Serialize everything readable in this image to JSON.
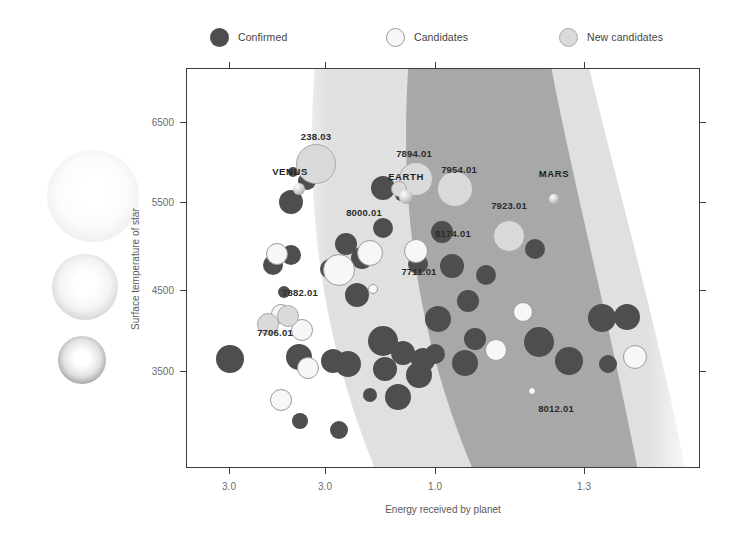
{
  "legend": {
    "items": [
      {
        "label": "Confirmed",
        "color": "#4e4e4e",
        "left": 0,
        "style": "confirmed"
      },
      {
        "label": "Candidates",
        "color": "#f7f7f7",
        "left": 176,
        "style": "candidate"
      },
      {
        "label": "New candidates",
        "color": "#dadada",
        "left": 349,
        "style": "newcand"
      }
    ]
  },
  "orbs": [
    {
      "name": "star-orb-large",
      "cx": 93,
      "cy": 196,
      "r": 46,
      "core": "#ffffff",
      "mid": "#fbfbfb",
      "edge": "#ededed"
    },
    {
      "name": "star-orb-medium",
      "cx": 85,
      "cy": 287,
      "r": 33,
      "core": "#ffffff",
      "mid": "#f4f4f4",
      "edge": "#d2d2d2"
    },
    {
      "name": "star-orb-small",
      "cx": 82,
      "cy": 360,
      "r": 24,
      "core": "#ffffff",
      "mid": "#e2e2e2",
      "edge": "#9d9d9d"
    }
  ],
  "chart_data": {
    "type": "scatter",
    "title": "",
    "xlabel": "Energy received by planet",
    "ylabel": "Surface temperature of star",
    "xticks": [
      {
        "label": "3.0",
        "px": 43
      },
      {
        "label": "3.0",
        "px": 139
      },
      {
        "label": "1.0",
        "px": 249
      },
      {
        "label": "1.3",
        "px": 398
      }
    ],
    "yticks": [
      {
        "label": "6500",
        "px": 54
      },
      {
        "label": "5500",
        "px": 134
      },
      {
        "label": "4500",
        "px": 222
      },
      {
        "label": "3500",
        "px": 303
      }
    ],
    "grid": false,
    "legend_position": "top",
    "zones": {
      "description": "Curved habitable zone bands; outer light band and inner darker band, widening toward cooler stars",
      "outer_color": "#e0e0e0",
      "inner_color": "#a8a8a8"
    },
    "series": [
      {
        "name": "Confirmed",
        "color": "#4e4e4e",
        "points": [
          {
            "x": 104,
            "y": 133,
            "r": 12
          },
          {
            "x": 120,
            "y": 112,
            "r": 9
          },
          {
            "x": 106,
            "y": 103,
            "r": 5
          },
          {
            "x": 196,
            "y": 119,
            "r": 12
          },
          {
            "x": 214,
            "y": 126,
            "r": 6
          },
          {
            "x": 348,
            "y": 180,
            "r": 10
          },
          {
            "x": 86,
            "y": 196,
            "r": 10
          },
          {
            "x": 104,
            "y": 186,
            "r": 10
          },
          {
            "x": 143,
            "y": 200,
            "r": 10
          },
          {
            "x": 159,
            "y": 175,
            "r": 11
          },
          {
            "x": 175,
            "y": 189,
            "r": 11
          },
          {
            "x": 97,
            "y": 223,
            "r": 6
          },
          {
            "x": 170,
            "y": 226,
            "r": 12
          },
          {
            "x": 196,
            "y": 159,
            "r": 10
          },
          {
            "x": 255,
            "y": 163,
            "r": 11
          },
          {
            "x": 265,
            "y": 197,
            "r": 12
          },
          {
            "x": 231,
            "y": 195,
            "r": 10
          },
          {
            "x": 281,
            "y": 232,
            "r": 11
          },
          {
            "x": 299,
            "y": 206,
            "r": 10
          },
          {
            "x": 43,
            "y": 290,
            "r": 14
          },
          {
            "x": 112,
            "y": 288,
            "r": 13
          },
          {
            "x": 146,
            "y": 292,
            "r": 12
          },
          {
            "x": 161,
            "y": 295,
            "r": 13
          },
          {
            "x": 196,
            "y": 272,
            "r": 15
          },
          {
            "x": 216,
            "y": 284,
            "r": 12
          },
          {
            "x": 198,
            "y": 300,
            "r": 12
          },
          {
            "x": 232,
            "y": 306,
            "r": 13
          },
          {
            "x": 211,
            "y": 328,
            "r": 13
          },
          {
            "x": 183,
            "y": 326,
            "r": 7
          },
          {
            "x": 113,
            "y": 352,
            "r": 8
          },
          {
            "x": 152,
            "y": 361,
            "r": 9
          },
          {
            "x": 251,
            "y": 250,
            "r": 13
          },
          {
            "x": 248,
            "y": 285,
            "r": 10
          },
          {
            "x": 278,
            "y": 294,
            "r": 13
          },
          {
            "x": 288,
            "y": 270,
            "r": 11
          },
          {
            "x": 352,
            "y": 273,
            "r": 15
          },
          {
            "x": 382,
            "y": 292,
            "r": 14
          },
          {
            "x": 415,
            "y": 249,
            "r": 14
          },
          {
            "x": 440,
            "y": 248,
            "r": 13
          },
          {
            "x": 421,
            "y": 295,
            "r": 9
          },
          {
            "x": 236,
            "y": 291,
            "r": 12
          }
        ]
      },
      {
        "name": "Candidates",
        "color": "#f7f7f7",
        "points": [
          {
            "x": 90,
            "y": 185,
            "r": 11
          },
          {
            "x": 152,
            "y": 201,
            "r": 16
          },
          {
            "x": 183,
            "y": 184,
            "r": 13
          },
          {
            "x": 229,
            "y": 182,
            "r": 12
          },
          {
            "x": 94,
            "y": 245,
            "r": 10
          },
          {
            "x": 115,
            "y": 261,
            "r": 11
          },
          {
            "x": 186,
            "y": 220,
            "r": 5
          },
          {
            "x": 121,
            "y": 299,
            "r": 11
          },
          {
            "x": 94,
            "y": 331,
            "r": 11
          },
          {
            "x": 336,
            "y": 243,
            "r": 10
          },
          {
            "x": 309,
            "y": 281,
            "r": 11
          },
          {
            "x": 448,
            "y": 288,
            "r": 12
          },
          {
            "x": 345,
            "y": 322,
            "r": 4
          }
        ]
      },
      {
        "name": "New candidates",
        "color": "#dadada",
        "points": [
          {
            "x": 129,
            "y": 95,
            "r": 20
          },
          {
            "x": 229,
            "y": 110,
            "r": 17
          },
          {
            "x": 268,
            "y": 120,
            "r": 18
          },
          {
            "x": 212,
            "y": 120,
            "r": 8
          },
          {
            "x": 322,
            "y": 167,
            "r": 16
          },
          {
            "x": 81,
            "y": 255,
            "r": 11
          },
          {
            "x": 101,
            "y": 247,
            "r": 11
          }
        ]
      }
    ],
    "solar_system": [
      {
        "name": "VENUS",
        "x": 112,
        "y": 120,
        "r": 6
      },
      {
        "name": "EARTH",
        "x": 219,
        "y": 128,
        "r": 7
      },
      {
        "name": "MARS",
        "x": 367,
        "y": 130,
        "r": 5
      }
    ],
    "annotations": [
      {
        "text": "238.03",
        "x": 129,
        "y": 67,
        "anchor": "center"
      },
      {
        "text": "VENUS",
        "x": 103,
        "y": 102,
        "anchor": "center",
        "solar": true
      },
      {
        "text": "7894.01",
        "x": 227,
        "y": 84,
        "anchor": "center"
      },
      {
        "text": "EARTH",
        "x": 219,
        "y": 107,
        "anchor": "center",
        "solar": true
      },
      {
        "text": "7954.01",
        "x": 272,
        "y": 100,
        "anchor": "center"
      },
      {
        "text": "MARS",
        "x": 367,
        "y": 104,
        "anchor": "center",
        "solar": true
      },
      {
        "text": "8000.01",
        "x": 177,
        "y": 143,
        "anchor": "center"
      },
      {
        "text": "7711.01",
        "x": 232,
        "y": 202,
        "anchor": "center"
      },
      {
        "text": "7923.01",
        "x": 322,
        "y": 136,
        "anchor": "center"
      },
      {
        "text": "8174.01",
        "x": 266,
        "y": 164,
        "anchor": "center"
      },
      {
        "text": "7882.01",
        "x": 113,
        "y": 223,
        "anchor": "center"
      },
      {
        "text": "7706.01",
        "x": 88,
        "y": 263,
        "anchor": "center"
      },
      {
        "text": "8012.01",
        "x": 369,
        "y": 339,
        "anchor": "center"
      }
    ]
  }
}
